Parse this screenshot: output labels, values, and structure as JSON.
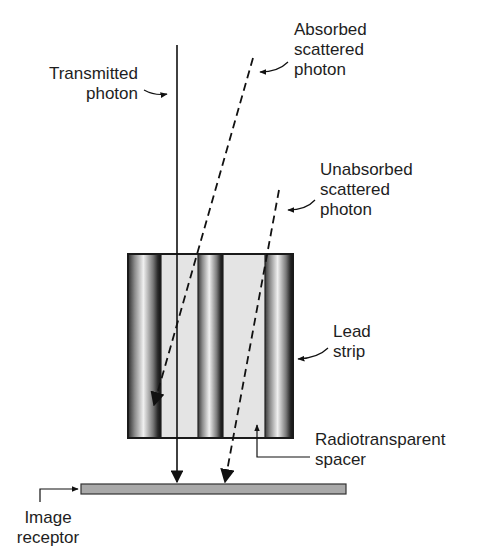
{
  "diagram": {
    "labels": {
      "transmitted": [
        "Transmitted",
        "photon"
      ],
      "absorbed": [
        "Absorbed",
        "scattered",
        "photon"
      ],
      "unabsorbed": [
        "Unabsorbed",
        "scattered",
        "photon"
      ],
      "lead_strip": [
        "Lead",
        "strip"
      ],
      "spacer": [
        "Radiotransparent",
        "spacer"
      ],
      "receptor": [
        "Image",
        "receptor"
      ]
    },
    "colors": {
      "line": "#111111",
      "strip_dark": "#1a1a1a",
      "strip_mid": "#8a8a8a",
      "strip_light": "#e8e8e8",
      "spacer": "#e4e4e4",
      "receptor": "#a9a9a9"
    }
  }
}
